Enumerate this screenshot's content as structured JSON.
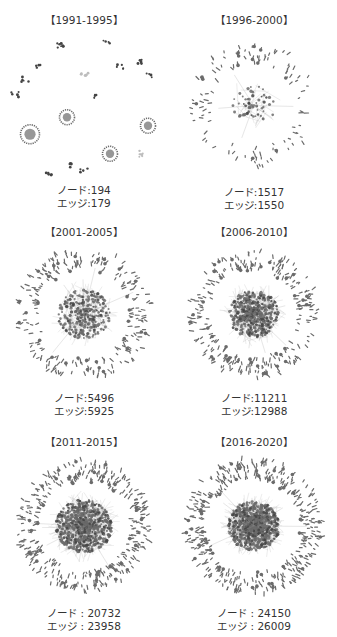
{
  "figure": {
    "panels": [
      {
        "period": "【1991-1995】",
        "node_label": "ノード",
        "node_value": "194",
        "edge_label": "エッジ",
        "edge_value": "179",
        "sep": ":"
      },
      {
        "period": "【1996-2000】",
        "node_label": "ノード",
        "node_value": "1517",
        "edge_label": "エッジ",
        "edge_value": "1550",
        "sep": ":"
      },
      {
        "period": "【2001-2005】",
        "node_label": "ノード",
        "node_value": "5496",
        "edge_label": "エッジ",
        "edge_value": "5925",
        "sep": ":"
      },
      {
        "period": "【2006-2010】",
        "node_label": "ノード",
        "node_value": "11211",
        "edge_label": "エッジ",
        "edge_value": "12988",
        "sep": ":"
      },
      {
        "period": "【2011-2015】",
        "node_label": "ノード",
        "node_value": "20732",
        "edge_label": "エッジ",
        "edge_value": "23958",
        "sep": " : "
      },
      {
        "period": "【2016-2020】",
        "node_label": "ノード",
        "node_value": "24150",
        "edge_label": "エッジ",
        "edge_value": "26009",
        "sep": " : "
      }
    ],
    "colors": {
      "node": "#6b6b6b",
      "node_dark": "#444444",
      "edge": "#9a9a9a",
      "light": "#bdbdbd"
    }
  },
  "graphs": [
    {
      "style": "clusters",
      "seed": 3,
      "core": 0,
      "ring": 18
    },
    {
      "style": "network",
      "seed": 7,
      "core": 60,
      "ring": 110,
      "coreR": 22,
      "ringR": 58
    },
    {
      "style": "network",
      "seed": 11,
      "core": 260,
      "ring": 230,
      "coreR": 26,
      "ringR": 62
    },
    {
      "style": "network",
      "seed": 13,
      "core": 420,
      "ring": 260,
      "coreR": 25,
      "ringR": 60
    },
    {
      "style": "network",
      "seed": 17,
      "core": 650,
      "ring": 340,
      "coreR": 28,
      "ringR": 62
    },
    {
      "style": "network",
      "seed": 19,
      "core": 700,
      "ring": 380,
      "coreR": 26,
      "ringR": 64
    }
  ]
}
